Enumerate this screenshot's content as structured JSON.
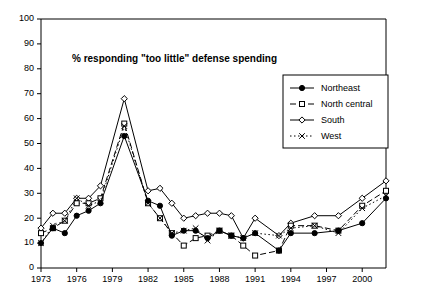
{
  "chart_data": {
    "type": "line",
    "title": "% responding \"too little\" defense spending",
    "xlabel": "",
    "ylabel": "",
    "xlim": [
      1973,
      2002
    ],
    "ylim": [
      0,
      100
    ],
    "ytick_step": 10,
    "yticks": [
      0,
      10,
      20,
      30,
      40,
      50,
      60,
      70,
      80,
      90,
      100
    ],
    "xticks": [
      1973,
      1976,
      1979,
      1982,
      1985,
      1988,
      1991,
      1994,
      1997,
      2000
    ],
    "xtick_labels": [
      "1973",
      "1976",
      "1979",
      "1982",
      "1985",
      "1988",
      "1991",
      "1994",
      "1997",
      "2000"
    ],
    "grid": false,
    "legend_position": "upper-right",
    "x": [
      1973,
      1974,
      1975,
      1976,
      1977,
      1978,
      1980,
      1982,
      1983,
      1984,
      1985,
      1986,
      1987,
      1988,
      1989,
      1990,
      1991,
      1993,
      1994,
      1996,
      1998,
      2000,
      2002
    ],
    "series": [
      {
        "name": "Northeast",
        "marker": "filled-circle",
        "dash": "solid",
        "values": [
          10,
          16,
          14,
          21,
          23,
          26,
          53,
          27,
          25,
          13,
          15,
          15,
          12,
          15,
          13,
          12,
          14,
          7,
          14,
          14,
          15,
          18,
          28
        ]
      },
      {
        "name": "North central",
        "marker": "open-square",
        "dash": "dashed",
        "values": [
          14,
          16,
          19,
          26,
          26,
          28,
          58,
          26,
          20,
          14,
          9,
          12,
          13,
          15,
          13,
          9,
          5,
          7,
          17,
          17,
          15,
          25,
          31
        ]
      },
      {
        "name": "South",
        "marker": "open-diamond",
        "dash": "solid",
        "values": [
          16,
          22,
          22,
          28,
          28,
          33,
          68,
          31,
          32,
          26,
          20,
          21,
          22,
          22,
          21,
          12,
          20,
          13,
          18,
          21,
          21,
          28,
          35
        ]
      },
      {
        "name": "West",
        "marker": "cross-x",
        "dash": "dotted",
        "values": [
          10,
          17,
          19,
          28,
          25,
          27,
          57,
          26,
          20,
          14,
          15,
          16,
          11,
          15,
          13,
          12,
          14,
          13,
          16,
          17,
          14,
          24,
          29
        ]
      }
    ]
  },
  "legend": {
    "entries": [
      {
        "label": "Northeast"
      },
      {
        "label": "North central"
      },
      {
        "label": "South"
      },
      {
        "label": "West"
      }
    ]
  }
}
